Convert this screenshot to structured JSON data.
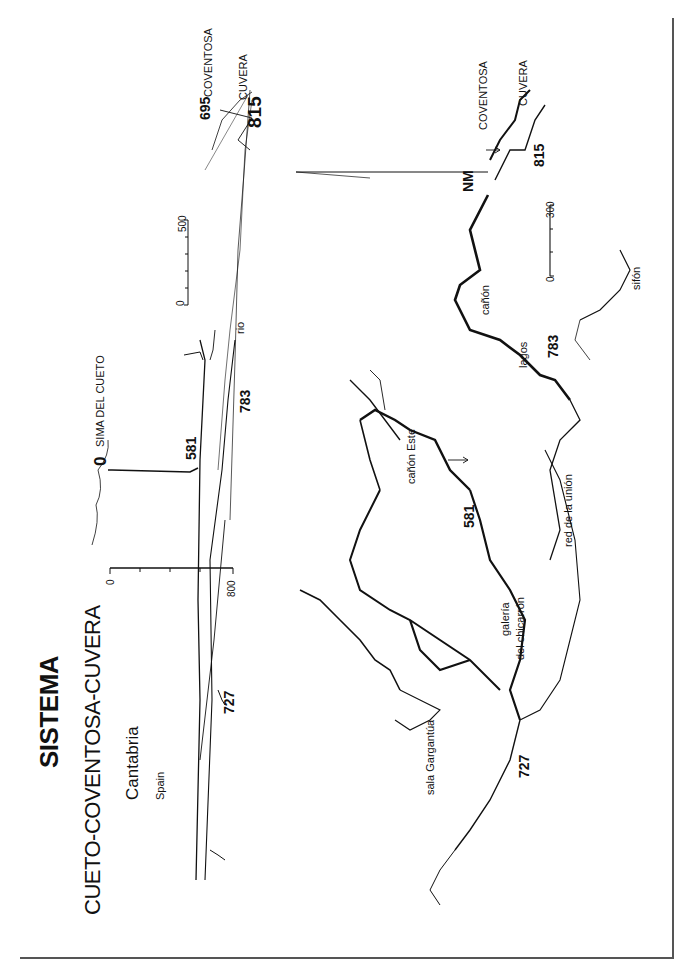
{
  "title": {
    "line1": "SISTEMA",
    "line2": "CUETO-COVENTOSA-CUVERA",
    "region": "Cantabria",
    "country": "Spain"
  },
  "profile": {
    "entrance_label": "SIMA DEL CUETO",
    "entrance_depth": "0",
    "depth_581": "581",
    "depth_783": "783",
    "depth_727": "727",
    "depth_695": "695",
    "depth_815": "815",
    "coventosa": "COVENTOSA",
    "cuvera": "CUVERA",
    "rio": "rio",
    "vertical_scale": {
      "min": "0",
      "max": "800"
    },
    "horizontal_scale": {
      "min": "0",
      "max": "500"
    }
  },
  "plan": {
    "north": "NM",
    "coventosa": "COVENTOSA",
    "cuvera": "CUVERA",
    "depth_815": "815",
    "depth_783": "783",
    "depth_581": "581",
    "depth_727": "727",
    "canon": "cañón",
    "lagos": "lagos",
    "sifon": "sifón",
    "canon_este": "cañón Este",
    "red_union": "red de la unión",
    "galeria": "galería",
    "chicarron": "del chicarrón",
    "sala": "sala Gargantúa",
    "scale": {
      "min": "0",
      "max": "300"
    }
  },
  "colors": {
    "ink": "#111111",
    "paper": "#ffffff",
    "frame": "#555555"
  }
}
